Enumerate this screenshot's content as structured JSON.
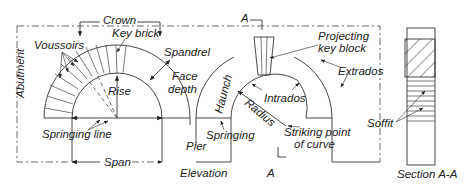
{
  "figure": {
    "title": "Elevation",
    "section_title": "Section A-A",
    "section_marker": "A"
  },
  "labels": {
    "crown": "Crown",
    "key_brick": "Key brick",
    "voussoirs": "Voussoirs",
    "spandrel": "Spandrel",
    "face_depth_1": "Face",
    "face_depth_2": "depth",
    "abutment": "Abutment",
    "rise": "Rise",
    "springing_line": "Springing line",
    "span": "Span",
    "pier": "Pier",
    "elevation": "Elevation",
    "haunch": "Haunch",
    "springing": "Springing",
    "radius": "Radius",
    "intrados": "Intrados",
    "extrados": "Extrados",
    "striking_point_1": "Striking point",
    "striking_point_2": "of curve",
    "projecting_key_block_1": "Projecting",
    "projecting_key_block_2": "key block",
    "soffit": "Soffit",
    "section_a_top": "A",
    "section_a_bottom": "A",
    "section_aa": "Section A-A"
  },
  "colors": {
    "line": "#333333",
    "text": "#222222",
    "background": "#ffffff"
  }
}
